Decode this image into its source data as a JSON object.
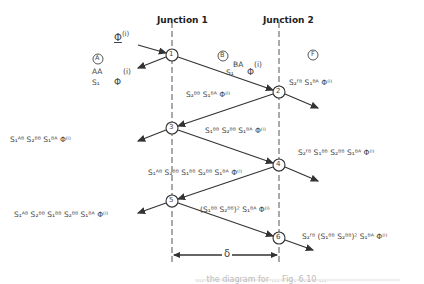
{
  "headers": {
    "junction1": "Junction 1",
    "junction2": "Junction 2"
  },
  "regions": {
    "A": "A",
    "B": "B",
    "F": "F"
  },
  "nodes": [
    "1",
    "2",
    "3",
    "4",
    "5",
    "6"
  ],
  "incident": {
    "label": "Φ",
    "sup": "(i)"
  },
  "terms": {
    "A_AA": {
      "sub": "S₁",
      "sup": "AA",
      "phi": "Φ",
      "i": "(i)"
    },
    "B_BA": {
      "sub": "S₁",
      "sup": "BA",
      "phi": "Φ",
      "i": "(i)"
    },
    "F1": "S₂ᶠᴮ S₁ᴮᴬ Φ⁽ⁱ⁾",
    "seg23": "S₂ᴮᴮ S₁ᴮᴬ Φ⁽ⁱ⁾",
    "left3": "S₁ᴬᴮ S₂ᴮᴮ S₁ᴮᴬ Φ⁽ⁱ⁾",
    "seg34": "S₁ᴮᴮ S₂ᴮᴮ S₁ᴮᴬ Φ⁽ⁱ⁾",
    "F4": "S₂ᶠᴮ S₁ᴮᴮ S₂ᴮᴮ S₁ᴮᴬ Φ⁽ⁱ⁾",
    "seg45": "S₁ᴬᴮ S₂ᴮᴮ S₁ᴮᴮ S₂ᴮᴮ S₁ᴮᴬ Φ⁽ⁱ⁾",
    "seg56": "(S₁ᴮᴮ S₂ᴮᴮ)² S₁ᴮᴬ Φ⁽ⁱ⁾",
    "left5": "S₁ᴬᴮ S₂ᴮᴮ S₁ᴮᴮ S₂ᴮᴮ S₁ᴮᴬ Φ⁽ⁱ⁾",
    "F6": "S₂ᶠᴮ (S₁ᴮᴮ S₂ᴮᴮ)² S₁ᴮᴬ Φ⁽ⁱ⁾"
  },
  "delta": "δ",
  "caption": "… the diagram for … Fig. 6.10 …"
}
